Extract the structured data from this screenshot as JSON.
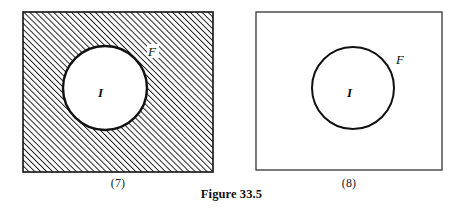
{
  "figure": {
    "caption": "Figure 33.5",
    "panels": [
      {
        "id": "7",
        "caption": "(7)",
        "fill": "hatched",
        "rect_stroke": "#111111",
        "hatch_color": "#1a1a1a",
        "hatch_background": "#ffffff",
        "disc": {
          "fill": "#ffffff",
          "stroke": "#111111",
          "stroke_width": 2.4
        },
        "labels": {
          "boundary_label": "F",
          "interior_label": "I"
        }
      },
      {
        "id": "8",
        "caption": "(8)",
        "fill": "plain",
        "rect_stroke": "#333333",
        "hatch_color": "",
        "hatch_background": "#ffffff",
        "disc": {
          "fill": "#ffffff",
          "stroke": "#111111",
          "stroke_width": 2.0
        },
        "labels": {
          "boundary_label": "F",
          "interior_label": "I"
        }
      }
    ]
  },
  "colors": {
    "ink": "#111111",
    "paper": "#ffffff"
  }
}
